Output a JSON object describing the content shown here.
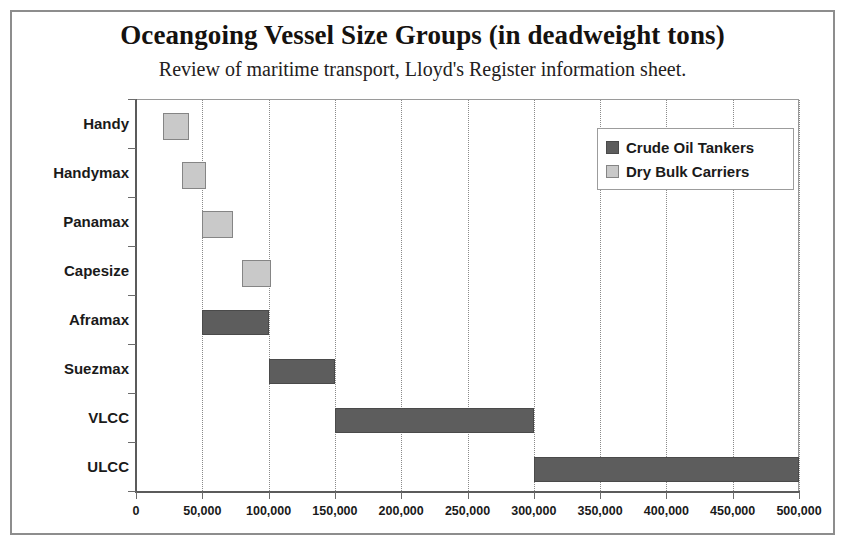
{
  "chart_data": {
    "type": "bar",
    "orientation": "horizontal-range",
    "title": "Oceangoing Vessel Size Groups (in deadweight tons)",
    "subtitle": "Review of maritime transport, Lloyd's Register information sheet.",
    "xlabel": "",
    "ylabel": "",
    "xlim": [
      0,
      500000
    ],
    "ylim": null,
    "grid": "vertical-dotted",
    "legend_position": "top-right",
    "categories": [
      "Handy",
      "Handymax",
      "Panamax",
      "Capesize",
      "Aframax",
      "Suezmax",
      "VLCC",
      "ULCC"
    ],
    "x_ticks": [
      0,
      50000,
      100000,
      150000,
      200000,
      250000,
      300000,
      350000,
      400000,
      450000,
      500000
    ],
    "x_tick_labels": [
      "0",
      "50,000",
      "100,000",
      "150,000",
      "200,000",
      "250,000",
      "300,000",
      "350,000",
      "400,000",
      "450,000",
      "500,000"
    ],
    "series": [
      {
        "name": "Crude Oil Tankers",
        "color": "#5d5d5d",
        "ranges": [
          {
            "category": "Aframax",
            "start": 50000,
            "end": 100000
          },
          {
            "category": "Suezmax",
            "start": 100000,
            "end": 150000
          },
          {
            "category": "VLCC",
            "start": 150000,
            "end": 300000
          },
          {
            "category": "ULCC",
            "start": 300000,
            "end": 500000
          }
        ]
      },
      {
        "name": "Dry Bulk Carriers",
        "color": "#c9c9c9",
        "ranges": [
          {
            "category": "Handy",
            "start": 20000,
            "end": 40000
          },
          {
            "category": "Handymax",
            "start": 35000,
            "end": 53000
          },
          {
            "category": "Panamax",
            "start": 50000,
            "end": 73000
          },
          {
            "category": "Capesize",
            "start": 80000,
            "end": 102000
          }
        ]
      }
    ],
    "bars": [
      {
        "category": "Handy",
        "series": "Dry Bulk Carriers",
        "start": 20000,
        "end": 40000
      },
      {
        "category": "Handymax",
        "series": "Dry Bulk Carriers",
        "start": 35000,
        "end": 53000
      },
      {
        "category": "Panamax",
        "series": "Dry Bulk Carriers",
        "start": 50000,
        "end": 73000
      },
      {
        "category": "Capesize",
        "series": "Dry Bulk Carriers",
        "start": 80000,
        "end": 102000
      },
      {
        "category": "Aframax",
        "series": "Crude Oil Tankers",
        "start": 50000,
        "end": 100000
      },
      {
        "category": "Suezmax",
        "series": "Crude Oil Tankers",
        "start": 100000,
        "end": 150000
      },
      {
        "category": "VLCC",
        "series": "Crude Oil Tankers",
        "start": 150000,
        "end": 300000
      },
      {
        "category": "ULCC",
        "series": "Crude Oil Tankers",
        "start": 300000,
        "end": 500000
      }
    ]
  },
  "legend": {
    "items": [
      {
        "label": "Crude Oil Tankers",
        "key": "crude"
      },
      {
        "label": "Dry Bulk Carriers",
        "key": "drybulk"
      }
    ]
  }
}
